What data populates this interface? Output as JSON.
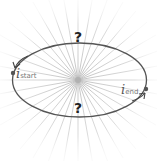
{
  "diagram": {
    "title": "",
    "center": {
      "x": 78,
      "y": 80
    },
    "ellipse": {
      "cx": 79.5,
      "cy": 80,
      "rx": 67,
      "ry": 37,
      "stroke": "#555555"
    },
    "radial_line_count": 36,
    "radial_line_color": "#cccccc",
    "labels": {
      "start": {
        "symbol": "i",
        "subscript": "start"
      },
      "end": {
        "symbol": "i",
        "subscript": "end"
      },
      "top_question": "?",
      "bottom_question": "?"
    },
    "points": {
      "start": {
        "x": 13,
        "y": 73
      },
      "end": {
        "x": 146,
        "y": 89
      }
    }
  }
}
